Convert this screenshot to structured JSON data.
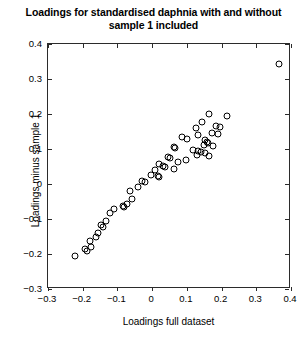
{
  "chart_data": {
    "type": "scatter",
    "title": "Loadings for standardised daphnia with and without sample 1 included",
    "title_line1": "Loadings for standardised daphnia with and without",
    "title_line2": "sample 1 included",
    "xlabel": "Loadings full dataset",
    "ylabel": "Loadings minus sample 1",
    "xlim": [
      -0.3,
      0.4
    ],
    "ylim": [
      -0.3,
      0.4
    ],
    "xticks": [
      -0.3,
      -0.2,
      -0.1,
      0,
      0.1,
      0.2,
      0.3,
      0.4
    ],
    "yticks": [
      -0.3,
      -0.2,
      -0.1,
      0,
      0.1,
      0.2,
      0.3,
      0.4
    ],
    "xticklabels": [
      "-0.3",
      "-0.2",
      "-0.1",
      "0",
      "0.1",
      "0.2",
      "0.3",
      "0.4"
    ],
    "yticklabels": [
      "-0.3",
      "-0.2",
      "-0.1",
      "0",
      "0.1",
      "0.2",
      "0.3",
      "0.4"
    ],
    "grid": false,
    "legend": null,
    "marker": "open-circle",
    "marker_color": "#000000",
    "points": [
      [
        0.365,
        0.342
      ],
      [
        0.165,
        0.201
      ],
      [
        0.215,
        0.194
      ],
      [
        0.145,
        0.176
      ],
      [
        0.183,
        0.167
      ],
      [
        0.196,
        0.163
      ],
      [
        0.127,
        0.16
      ],
      [
        0.172,
        0.147
      ],
      [
        0.19,
        0.144
      ],
      [
        0.131,
        0.139
      ],
      [
        0.085,
        0.133
      ],
      [
        0.101,
        0.13
      ],
      [
        0.152,
        0.125
      ],
      [
        0.157,
        0.121
      ],
      [
        0.16,
        0.118
      ],
      [
        0.148,
        0.112
      ],
      [
        0.175,
        0.108
      ],
      [
        0.063,
        0.106
      ],
      [
        0.066,
        0.103
      ],
      [
        0.118,
        0.098
      ],
      [
        0.133,
        0.095
      ],
      [
        0.142,
        0.092
      ],
      [
        0.151,
        0.088
      ],
      [
        0.128,
        0.082
      ],
      [
        0.163,
        0.08
      ],
      [
        0.046,
        0.077
      ],
      [
        0.05,
        0.074
      ],
      [
        0.098,
        0.07
      ],
      [
        0.075,
        0.062
      ],
      [
        0.02,
        0.058
      ],
      [
        0.032,
        0.052
      ],
      [
        0.037,
        0.049
      ],
      [
        0.064,
        0.044
      ],
      [
        0.009,
        0.04
      ],
      [
        -0.004,
        0.027
      ],
      [
        0.016,
        0.023
      ],
      [
        0.019,
        0.021
      ],
      [
        -0.028,
        0.009
      ],
      [
        -0.022,
        0.005
      ],
      [
        -0.04,
        -0.008
      ],
      [
        -0.065,
        -0.021
      ],
      [
        -0.058,
        -0.043
      ],
      [
        -0.072,
        -0.056
      ],
      [
        -0.085,
        -0.062
      ],
      [
        -0.081,
        -0.066
      ],
      [
        -0.109,
        -0.07
      ],
      [
        -0.121,
        -0.082
      ],
      [
        -0.132,
        -0.107
      ],
      [
        -0.147,
        -0.118
      ],
      [
        -0.142,
        -0.122
      ],
      [
        -0.157,
        -0.14
      ],
      [
        -0.163,
        -0.152
      ],
      [
        -0.179,
        -0.163
      ],
      [
        -0.176,
        -0.18
      ],
      [
        -0.192,
        -0.186
      ],
      [
        -0.188,
        -0.19
      ],
      [
        -0.221,
        -0.207
      ]
    ]
  }
}
